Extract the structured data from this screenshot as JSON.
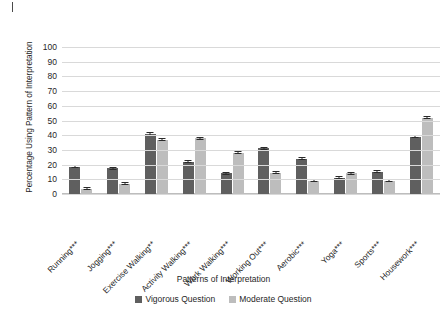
{
  "chart_data": {
    "type": "bar",
    "title": "",
    "xlabel": "Patterns of Interpretation",
    "ylabel": "Percentage Using Pattern of Interpretation",
    "ylim": [
      0,
      100
    ],
    "ytick_labels": [
      "100",
      "90",
      "80",
      "70",
      "60",
      "50",
      "40",
      "30",
      "20",
      "10",
      "0"
    ],
    "yticks": [
      100,
      90,
      80,
      70,
      60,
      50,
      40,
      30,
      20,
      10,
      0
    ],
    "grid": "horizontal",
    "legend_position": "bottom",
    "categories": [
      "Running***",
      "Jogging***",
      "Exercise Walking**",
      "Activity Walking***",
      "Work Walking***",
      "Working Out***",
      "Aerobic***",
      "Yoga***",
      "Sports***",
      "Housework***"
    ],
    "series": [
      {
        "name": "Vigorous Question",
        "color": "#5f5f5f",
        "values": [
          18.5,
          17.5,
          41,
          22,
          14,
          31,
          24,
          11,
          15,
          39
        ],
        "errors": [
          1.0,
          0.9,
          1.2,
          1.0,
          0.8,
          1.0,
          1.0,
          0.8,
          0.9,
          1.0
        ]
      },
      {
        "name": "Moderate Question",
        "color": "#bdbdbd",
        "values": [
          3.5,
          7,
          37,
          38,
          28,
          14.5,
          9,
          14,
          9,
          52
        ],
        "errors": [
          0.6,
          0.8,
          1.0,
          1.1,
          1.0,
          0.9,
          0.8,
          0.8,
          0.8,
          1.2
        ]
      }
    ]
  },
  "legend": {
    "items": [
      {
        "label": "Vigorous Question"
      },
      {
        "label": "Moderate Question"
      }
    ]
  }
}
